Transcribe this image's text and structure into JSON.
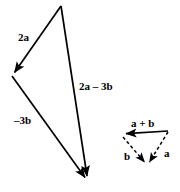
{
  "figure": {
    "background_color": "#ffffff",
    "stroke_color": "#000000",
    "stroke_width": 1.6,
    "labels": {
      "two_a": "2a",
      "two_a_minus_three_b": "2a – 3b",
      "minus_three_b": "–3b",
      "a_plus_b": "a + b",
      "b": "b",
      "a": "a"
    },
    "large_triangle": {
      "name": "vector-triangle-large",
      "line_style": "solid",
      "vertices": {
        "top": [
          61,
          6
        ],
        "left": [
          12,
          76
        ],
        "bottom": [
          88,
          182
        ]
      },
      "edges": [
        {
          "name": "edge-2a",
          "from": [
            61,
            6
          ],
          "to": [
            12,
            76
          ],
          "arrow_at": "to",
          "label": "2a"
        },
        {
          "name": "edge-minus-3b",
          "from": [
            12,
            76
          ],
          "to": [
            88,
            182
          ],
          "arrow_at": "to",
          "label": "–3b"
        },
        {
          "name": "edge-2a-minus-3b",
          "from": [
            61,
            6
          ],
          "to": [
            88,
            182
          ],
          "arrow_at": "to",
          "label": "2a – 3b"
        }
      ]
    },
    "small_triangle": {
      "name": "vector-triangle-small",
      "vertices": {
        "left": [
          122,
          134
        ],
        "right": [
          168,
          131
        ],
        "bottom": [
          147,
          166
        ]
      },
      "edges": [
        {
          "name": "edge-a-plus-b",
          "from": [
            168,
            131
          ],
          "to": [
            122,
            134
          ],
          "arrow_at": "to",
          "line_style": "solid",
          "label": "a + b"
        },
        {
          "name": "edge-a",
          "from": [
            168,
            131
          ],
          "to": [
            147,
            166
          ],
          "arrow_at": "to",
          "line_style": "dashed",
          "label": "a"
        },
        {
          "name": "edge-b",
          "from": [
            147,
            166
          ],
          "to": [
            122,
            134
          ],
          "arrow_at": "to",
          "line_style": "dashed",
          "label": "b"
        }
      ]
    }
  }
}
